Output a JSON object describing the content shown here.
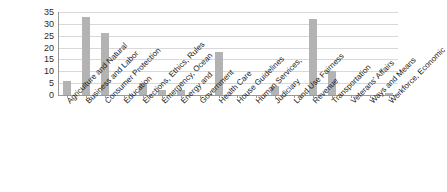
{
  "chart_data": {
    "type": "bar",
    "title": "",
    "subtitle": "",
    "xlabel": "",
    "ylabel": "",
    "ylim": [
      0,
      35
    ],
    "yticks": [
      0,
      5,
      10,
      15,
      20,
      25,
      30,
      35
    ],
    "grid": true,
    "legend": false,
    "legend_position": "none",
    "bar_color": "#b3b3b3",
    "categories": [
      "Agriculture and Natural",
      "Business and Labor",
      "Consumer Protection",
      "Education",
      "Elections, Ethics, Rules",
      "Emergency, Ocean",
      "Energy and",
      "Government",
      "Health Care",
      "House Guidelines",
      "Human Services,",
      "Judiciary",
      "Land Use Fairness",
      "Revenue",
      "Transportation",
      "Veterans' Affairs",
      "Ways and Means",
      "Workforce, Economic"
    ],
    "values": [
      6,
      33,
      26,
      0,
      5,
      2,
      2,
      0,
      18,
      0,
      0,
      4,
      0,
      32,
      10,
      0,
      0,
      1
    ]
  },
  "axis": {
    "y_tick_labels": [
      "35",
      "30",
      "25",
      "20",
      "15",
      "10",
      "5",
      "0"
    ]
  }
}
